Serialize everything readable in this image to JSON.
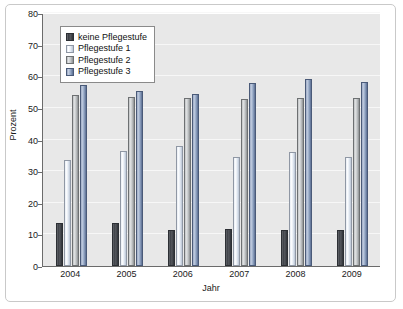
{
  "chart_data": {
    "type": "bar",
    "title": "",
    "xlabel": "Jahr",
    "ylabel": "Prozent",
    "categories": [
      "2004",
      "2005",
      "2006",
      "2007",
      "2008",
      "2009"
    ],
    "ylim": [
      0,
      80
    ],
    "yticks": [
      0,
      10,
      20,
      30,
      40,
      50,
      60,
      70,
      80
    ],
    "grid": true,
    "legend_position": "upper-left-inside",
    "series": [
      {
        "name": "keine Pflegestufe",
        "color": "#3d4046",
        "values": [
          13.5,
          13.5,
          11.5,
          11.8,
          11.5,
          11.5
        ]
      },
      {
        "name": "Pflegestufe 1",
        "color": "#e7edf5",
        "values": [
          33.5,
          36.5,
          37.8,
          34.5,
          36.0,
          34.5
        ]
      },
      {
        "name": "Pflegestufe 2",
        "color": "#c6c9cb",
        "values": [
          54.0,
          53.5,
          53.0,
          52.8,
          53.0,
          53.0
        ]
      },
      {
        "name": "Pflegestufe 3",
        "color": "#8e9dba",
        "values": [
          57.3,
          55.3,
          54.3,
          57.8,
          59.0,
          58.3
        ]
      }
    ]
  }
}
